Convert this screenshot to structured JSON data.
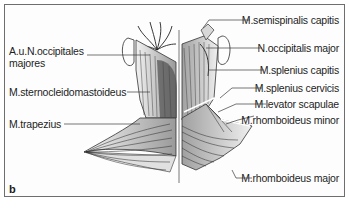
{
  "figure": {
    "panel_label": "b",
    "colors": {
      "border": "#6e6e6e",
      "line": "#3a3a3a",
      "text": "#1e1e1e",
      "background": "#fdfdfd"
    },
    "labels_left": [
      {
        "id": "occipitales",
        "line1": "A.u.N.occipitales",
        "line2": "majores"
      },
      {
        "id": "sternocleidomastoideus",
        "text": "M.sternocleidomastoideus"
      },
      {
        "id": "trapezius",
        "text": "M.trapezius"
      }
    ],
    "labels_right": [
      {
        "id": "semispinalis-capitis",
        "text": "M.semispinalis capitis"
      },
      {
        "id": "occipitalis-major",
        "text": "N.occipitalis major"
      },
      {
        "id": "splenius-capitis",
        "text": "M.splenius capitis"
      },
      {
        "id": "splenius-cervicis",
        "text": "M.splenius cervicis"
      },
      {
        "id": "levator-scapulae",
        "text": "M.levator scapulae"
      },
      {
        "id": "rhomboideus-minor",
        "text": "M.rhomboideus minor"
      },
      {
        "id": "rhomboideus-major",
        "text": "M.rhomboideus major"
      }
    ]
  }
}
